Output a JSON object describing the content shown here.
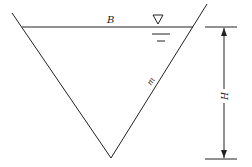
{
  "diagram": {
    "labels": {
      "top_width": "B",
      "side_slope": "m",
      "depth": "H"
    },
    "symbols": {
      "water_surface": "▽"
    },
    "colors": {
      "line": "#222222",
      "background": "#ffffff"
    }
  }
}
